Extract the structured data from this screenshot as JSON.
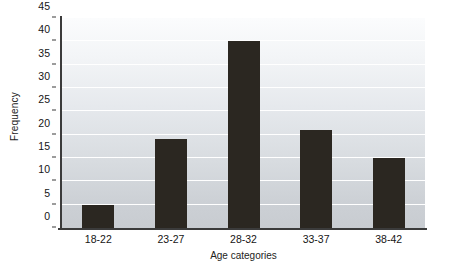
{
  "chart_data": {
    "type": "bar",
    "title": "",
    "subtitle": "",
    "xlabel": "Age categories",
    "ylabel": "Frequency",
    "categories": [
      "18-22",
      "23-27",
      "28-32",
      "33-37",
      "38-42"
    ],
    "values": [
      5,
      19,
      40,
      21,
      15
    ],
    "series": [
      {
        "name": "Frequency",
        "values": [
          5,
          19,
          40,
          21,
          15
        ]
      }
    ],
    "ylim": [
      0,
      45
    ],
    "ytick_values": [
      0,
      5,
      10,
      15,
      20,
      25,
      30,
      35,
      40,
      45
    ],
    "ytick_labels": [
      "0",
      "5",
      "10",
      "15",
      "20",
      "25",
      "30",
      "35",
      "40",
      "45"
    ],
    "xtick_labels": [
      "18-22",
      "23-27",
      "28-32",
      "33-37",
      "38-42"
    ],
    "grid": true,
    "grid_axis": "y",
    "grid_color": "#ffffff",
    "legend": false,
    "legend_position": "none",
    "bar_color": "#2b2721",
    "plot_background": "#dfe3e7",
    "axis_color": "#3b3b3b",
    "annotations": []
  }
}
